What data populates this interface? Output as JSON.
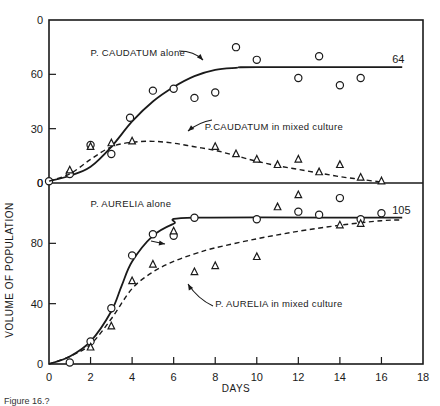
{
  "chart_data": [
    {
      "panel": "top",
      "type": "scatter",
      "xlabel": "DAYS",
      "ylabel": "VOLUME OF POPULATION",
      "xlim": [
        0,
        18
      ],
      "ylim": [
        0,
        90
      ],
      "x_ticks": [
        0,
        2,
        4,
        6,
        8,
        10,
        12,
        14,
        16,
        18
      ],
      "y_ticks": [
        0,
        30,
        60,
        90
      ],
      "y_tick_labels": [
        "0",
        "30",
        "60",
        "0"
      ],
      "series": [
        {
          "name": "P. CAUDATUM alone",
          "marker": "circle",
          "line": "solid",
          "end_label": "64",
          "points": [
            [
              0,
              1
            ],
            [
              1,
              5
            ],
            [
              2,
              21
            ],
            [
              3,
              16
            ],
            [
              3.9,
              36
            ],
            [
              5,
              51
            ],
            [
              6,
              52
            ],
            [
              7,
              47
            ],
            [
              8,
              50
            ],
            [
              9,
              75
            ],
            [
              10,
              68
            ],
            [
              12,
              58
            ],
            [
              13,
              70
            ],
            [
              14,
              54
            ],
            [
              15,
              58
            ]
          ],
          "curve": [
            [
              0,
              1
            ],
            [
              1,
              4
            ],
            [
              2,
              9
            ],
            [
              3,
              20
            ],
            [
              4,
              34
            ],
            [
              5,
              45
            ],
            [
              6,
              53
            ],
            [
              7,
              59
            ],
            [
              8,
              62.5
            ],
            [
              9,
              63.6
            ],
            [
              10,
              64
            ],
            [
              17,
              64
            ]
          ]
        },
        {
          "name": "P. CAUDATUM in mixed culture",
          "marker": "triangle",
          "line": "dashed",
          "points": [
            [
              1,
              7
            ],
            [
              2,
              20
            ],
            [
              3,
              22
            ],
            [
              4,
              23
            ],
            [
              8,
              20
            ],
            [
              9,
              16
            ],
            [
              10,
              13
            ],
            [
              11,
              10
            ],
            [
              12,
              13
            ],
            [
              13,
              6
            ],
            [
              14,
              10
            ],
            [
              15,
              3
            ],
            [
              16,
              1
            ]
          ],
          "curve": [
            [
              0,
              1
            ],
            [
              1,
              5
            ],
            [
              2,
              13
            ],
            [
              3,
              20
            ],
            [
              4,
              22.5
            ],
            [
              5,
              23
            ],
            [
              6,
              22
            ],
            [
              7,
              20
            ],
            [
              8,
              18
            ],
            [
              9,
              15
            ],
            [
              10,
              12
            ],
            [
              11,
              9.5
            ],
            [
              12,
              7.5
            ],
            [
              13,
              5.5
            ],
            [
              14,
              3.5
            ],
            [
              15,
              2
            ],
            [
              16,
              0.5
            ]
          ]
        }
      ],
      "annotations": [
        {
          "text": "P. CAUDATUM alone",
          "x": 2.0,
          "y": 70
        },
        {
          "text": "P.CAUDATUM in mixed culture",
          "x": 7.5,
          "y": 29
        }
      ]
    },
    {
      "panel": "bottom",
      "type": "scatter",
      "xlabel": "DAYS",
      "ylabel": "VOLUME OF POPULATION",
      "xlim": [
        0,
        18
      ],
      "ylim": [
        0,
        120
      ],
      "x_ticks": [
        0,
        2,
        4,
        6,
        8,
        10,
        12,
        14,
        16,
        18
      ],
      "y_ticks": [
        0,
        40,
        80,
        120
      ],
      "y_tick_labels": [
        "0",
        "40",
        "80",
        "0"
      ],
      "series": [
        {
          "name": "P. AURELIA alone",
          "marker": "circle",
          "line": "solid",
          "end_label": "105",
          "points": [
            [
              1,
              1
            ],
            [
              2,
              15
            ],
            [
              3,
              37
            ],
            [
              4,
              72
            ],
            [
              5,
              86
            ],
            [
              6,
              85
            ],
            [
              7,
              97
            ],
            [
              10,
              96
            ],
            [
              12,
              101
            ],
            [
              13,
              99
            ],
            [
              14,
              110
            ],
            [
              15,
              96
            ],
            [
              16,
              100
            ]
          ],
          "curve": [
            [
              0,
              0
            ],
            [
              1,
              5
            ],
            [
              2,
              15
            ],
            [
              3,
              35
            ],
            [
              3.5,
              52
            ],
            [
              4,
              68
            ],
            [
              5,
              85
            ],
            [
              6,
              93
            ],
            [
              7,
              97
            ],
            [
              17,
              97
            ]
          ]
        },
        {
          "name": "P. AURELIA in mixed culture",
          "marker": "triangle",
          "line": "dashed",
          "points": [
            [
              2,
              11
            ],
            [
              3,
              25
            ],
            [
              4,
              55
            ],
            [
              5,
              66
            ],
            [
              6,
              88
            ],
            [
              7,
              61
            ],
            [
              8,
              65
            ],
            [
              10,
              71
            ],
            [
              11,
              104
            ],
            [
              12,
              112
            ],
            [
              14,
              92
            ],
            [
              15,
              93
            ]
          ],
          "curve": [
            [
              0,
              0
            ],
            [
              1,
              5
            ],
            [
              2,
              13
            ],
            [
              3,
              30
            ],
            [
              4,
              50
            ],
            [
              5,
              61
            ],
            [
              6,
              68
            ],
            [
              7,
              73
            ],
            [
              8,
              77
            ],
            [
              10,
              83
            ],
            [
              12,
              88
            ],
            [
              14,
              92
            ],
            [
              16,
              95
            ],
            [
              17,
              95.5
            ]
          ]
        }
      ],
      "annotations": [
        {
          "text": "P. AURELIA alone",
          "x": 2.0,
          "y": 104
        },
        {
          "text": "P. AURELIA in mixed culture",
          "x": 8.0,
          "y": 38
        }
      ]
    }
  ],
  "labels": {
    "xlabel": "DAYS",
    "ylabel": "VOLUME OF POPULATION",
    "caption": "Figure 16.?"
  },
  "style": {
    "ink": "#1a1a1a",
    "background": "#ffffff"
  }
}
